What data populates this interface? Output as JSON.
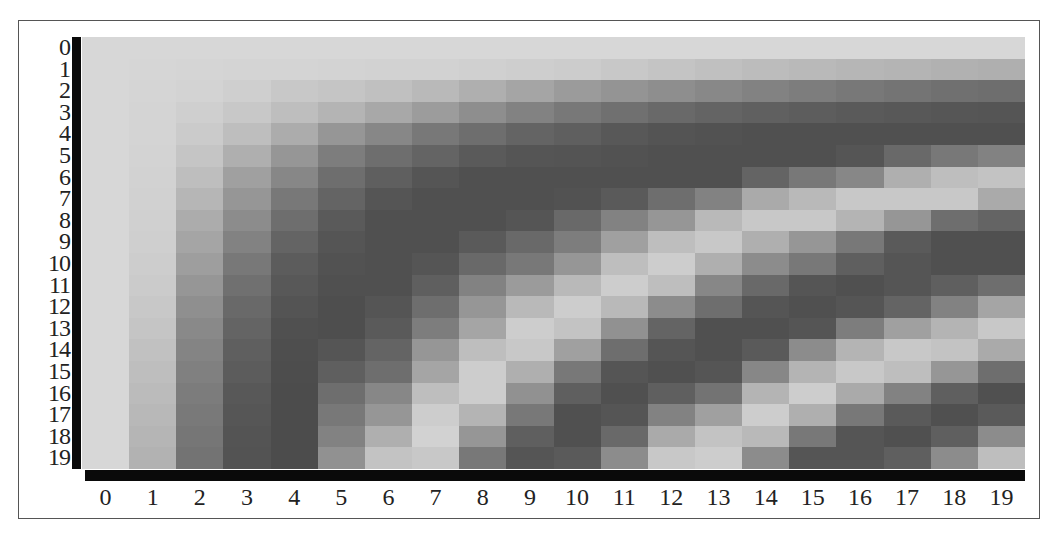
{
  "chart_data": {
    "type": "heatmap",
    "title": "",
    "xlabel": "",
    "ylabel": "",
    "colormap": "grayscale (light = high, dark = low)",
    "x_ticks": [
      "0",
      "1",
      "2",
      "3",
      "4",
      "5",
      "6",
      "7",
      "8",
      "9",
      "10",
      "11",
      "12",
      "13",
      "14",
      "15",
      "16",
      "17",
      "18",
      "19"
    ],
    "y_ticks": [
      "0",
      "1",
      "2",
      "3",
      "4",
      "5",
      "6",
      "7",
      "8",
      "9",
      "10",
      "11",
      "12",
      "13",
      "14",
      "15",
      "16",
      "17",
      "18",
      "19"
    ],
    "grid": false,
    "legend": null,
    "values": [
      [
        215,
        215,
        215,
        215,
        215,
        215,
        215,
        215,
        215,
        215,
        215,
        215,
        215,
        215,
        215,
        215,
        215,
        215,
        215,
        215
      ],
      [
        215,
        214,
        213,
        212,
        212,
        211,
        210,
        210,
        208,
        206,
        204,
        200,
        196,
        192,
        188,
        185,
        182,
        180,
        177,
        175
      ],
      [
        215,
        213,
        211,
        207,
        200,
        197,
        192,
        185,
        175,
        165,
        155,
        148,
        142,
        136,
        130,
        125,
        120,
        116,
        112,
        110
      ],
      [
        215,
        212,
        207,
        200,
        190,
        180,
        168,
        156,
        142,
        130,
        120,
        112,
        105,
        100,
        96,
        93,
        90,
        88,
        86,
        85
      ],
      [
        215,
        212,
        203,
        190,
        172,
        150,
        135,
        120,
        110,
        100,
        95,
        88,
        84,
        82,
        80,
        80,
        80,
        80,
        80,
        80
      ],
      [
        215,
        211,
        197,
        175,
        150,
        125,
        110,
        100,
        90,
        85,
        84,
        82,
        80,
        80,
        80,
        80,
        85,
        105,
        120,
        130
      ],
      [
        215,
        210,
        190,
        160,
        135,
        110,
        95,
        85,
        80,
        80,
        80,
        80,
        80,
        80,
        100,
        120,
        135,
        175,
        190,
        195
      ],
      [
        215,
        209,
        182,
        150,
        120,
        100,
        85,
        80,
        80,
        80,
        82,
        90,
        110,
        130,
        170,
        185,
        200,
        200,
        200,
        170
      ],
      [
        215,
        208,
        172,
        140,
        110,
        90,
        80,
        80,
        80,
        85,
        105,
        130,
        150,
        185,
        200,
        200,
        180,
        150,
        110,
        100
      ],
      [
        215,
        207,
        165,
        130,
        100,
        85,
        80,
        80,
        90,
        105,
        125,
        160,
        190,
        200,
        175,
        150,
        120,
        90,
        80,
        80
      ],
      [
        215,
        205,
        158,
        120,
        92,
        82,
        80,
        85,
        105,
        120,
        150,
        190,
        205,
        175,
        140,
        120,
        95,
        85,
        80,
        80
      ],
      [
        215,
        203,
        150,
        112,
        88,
        80,
        80,
        95,
        130,
        155,
        185,
        205,
        190,
        135,
        105,
        85,
        80,
        85,
        95,
        110
      ],
      [
        215,
        200,
        143,
        105,
        84,
        78,
        85,
        110,
        150,
        185,
        205,
        185,
        140,
        110,
        85,
        80,
        85,
        100,
        130,
        165
      ],
      [
        215,
        197,
        137,
        100,
        80,
        78,
        90,
        125,
        165,
        205,
        195,
        145,
        100,
        80,
        80,
        85,
        125,
        160,
        180,
        200
      ],
      [
        215,
        193,
        132,
        95,
        78,
        85,
        100,
        150,
        190,
        200,
        160,
        110,
        85,
        80,
        90,
        140,
        180,
        200,
        195,
        170
      ],
      [
        215,
        190,
        128,
        92,
        77,
        95,
        110,
        165,
        205,
        175,
        120,
        85,
        80,
        85,
        135,
        180,
        200,
        190,
        150,
        110
      ],
      [
        215,
        187,
        124,
        88,
        76,
        110,
        135,
        190,
        205,
        145,
        95,
        80,
        95,
        115,
        180,
        205,
        170,
        130,
        95,
        80
      ],
      [
        215,
        184,
        121,
        86,
        76,
        120,
        150,
        205,
        180,
        120,
        80,
        85,
        130,
        160,
        205,
        175,
        120,
        90,
        80,
        90
      ],
      [
        215,
        181,
        118,
        84,
        76,
        130,
        175,
        210,
        150,
        95,
        80,
        105,
        170,
        195,
        185,
        120,
        85,
        80,
        95,
        140
      ],
      [
        215,
        178,
        115,
        83,
        76,
        145,
        195,
        200,
        120,
        85,
        90,
        140,
        200,
        205,
        140,
        85,
        85,
        95,
        140,
        190
      ]
    ],
    "value_range": [
      76,
      215
    ]
  },
  "axes": {
    "axis_bar_color": "#0a0a0a",
    "frame_color": "#555555"
  }
}
